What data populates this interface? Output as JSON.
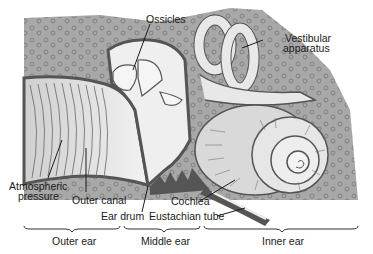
{
  "diagram": {
    "type": "anatomical cross-section",
    "labels": {
      "ossicles": "Ossicles",
      "vestibular_line1": "Vestibular",
      "vestibular_line2": "apparatus",
      "atmospheric_line1": "Atmospheric",
      "atmospheric_line2": "pressure",
      "outer_canal": "Outer canal",
      "ear_drum": "Ear drum",
      "cochlea": "Cochlea",
      "eustachian_tube": "Eustachian tube"
    },
    "regions": [
      {
        "label": "Outer ear"
      },
      {
        "label": "Middle ear"
      },
      {
        "label": "Inner ear"
      }
    ],
    "colors": {
      "bone": "#a8a8a8",
      "bone_dots": "#7d7d7d",
      "membrane": "#555555",
      "canal": "#d9d9d9",
      "cavity": "#efefef",
      "text": "#1a1a1a"
    }
  }
}
